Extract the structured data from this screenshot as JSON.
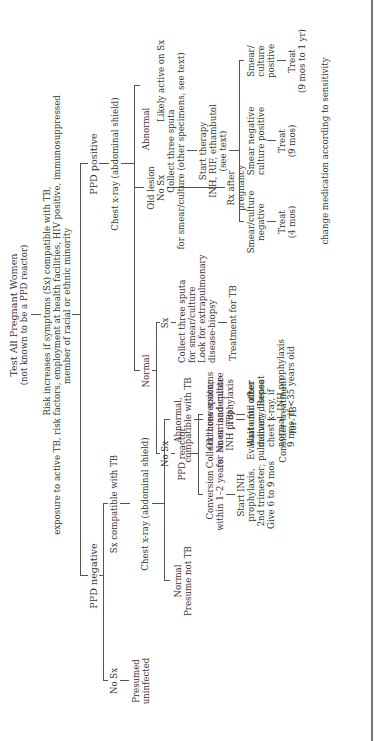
{
  "root": {
    "title": "Test All Pregnant Women",
    "subtitle": "(not known to be a PPD reactor)"
  },
  "risk": {
    "line1": "Risk increases if symptoms (Sx) compatible with TB,",
    "line2": "exposure to active TB, risk factors, employment at health facilities, HIV positive, immunosuppressed",
    "line3": "member of racial or ethnic minority"
  },
  "negative_branch": {
    "label": "PPD negative",
    "no_sx": "No Sx",
    "presumed": [
      "Presumed",
      "uninfected"
    ],
    "sx_compatible": "Sx compatible with TB",
    "chest_xray": "Chest x-ray (abdominal shield)",
    "normal": [
      "Normal",
      "Presume not TB"
    ],
    "abnormal": [
      "Abnormal,",
      "compatible with TB"
    ],
    "collect": [
      "Collect three sputums",
      "for smear and culture",
      "(TB)"
    ],
    "evaluate": [
      "Evaluate for other",
      "pulmonary disease"
    ],
    "consider": [
      "Consider treatment",
      "for TB"
    ]
  },
  "positive_branch": {
    "label": "PPD positive",
    "chest_xray": "Chest x-ray (abdominal shield)",
    "normal": "Normal",
    "no_sx": "No Sx",
    "sx": "Sx",
    "ppd_reactor": "PPD reactor",
    "collect_sputa": [
      "Collect three sputa",
      "for smear/culture",
      "Look for extrapulmonary",
      "disease-biopsy"
    ],
    "treatment_tb": "Treatment for TB",
    "conversion": [
      "Conversion",
      "within 1–2 years"
    ],
    "old_conversion": [
      "Old conversion;",
      "No or inadequate",
      "INH prophylaxis"
    ],
    "start_inh": [
      "Start INH",
      "prophylaxis,",
      "2nd trimester;",
      "Give 6 to 9 mos"
    ],
    "wait_until": [
      "Wait until after",
      "delivery; Repeat",
      "chest x-ray, if",
      "normal, INH prophylaxis",
      "9 mos, if <35 years old"
    ],
    "old_lesion": [
      "Old lesion",
      "No Sx"
    ],
    "rx_after": [
      "Rx after",
      "pregnancy"
    ],
    "abnormal": "Abnormal",
    "likely_active": "Likely active on Sx",
    "collect_three": [
      "Collect three sputa",
      "for smear/culture (other specimens, see text)"
    ],
    "start_therapy": [
      "Start therapy",
      "INH, RIF, ethambutol",
      "(see text)"
    ],
    "smear_culture_negative": [
      "Smear/culture",
      "negative"
    ],
    "smear_negative_culture_positive": [
      "Smear negative",
      "culture positive"
    ],
    "smear_culture_positive": [
      "Smear/",
      "culture",
      "positive"
    ],
    "treat_4": [
      "Treat",
      "(4 mos)"
    ],
    "treat_9": [
      "Treat",
      "(9 mos)"
    ],
    "treat_9_1yr": [
      "Treat",
      "(9 mos to 1 yr)"
    ],
    "change_medication": "change medication according to sensitivity"
  }
}
